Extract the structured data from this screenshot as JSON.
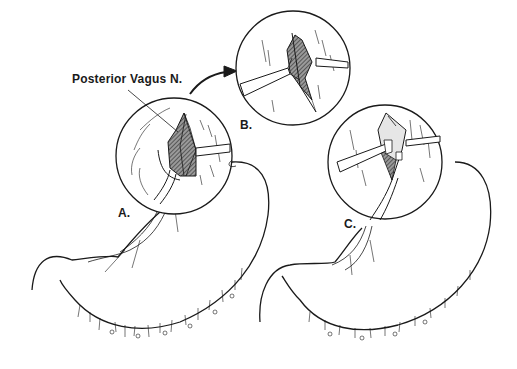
{
  "figure": {
    "labels": {
      "nerve": "Posterior Vagus N.",
      "panel_a": "A.",
      "panel_b": "B.",
      "panel_c": "C."
    },
    "colors": {
      "ink": "#1a1a1a",
      "background": "#ffffff",
      "shading": "#555555"
    }
  }
}
